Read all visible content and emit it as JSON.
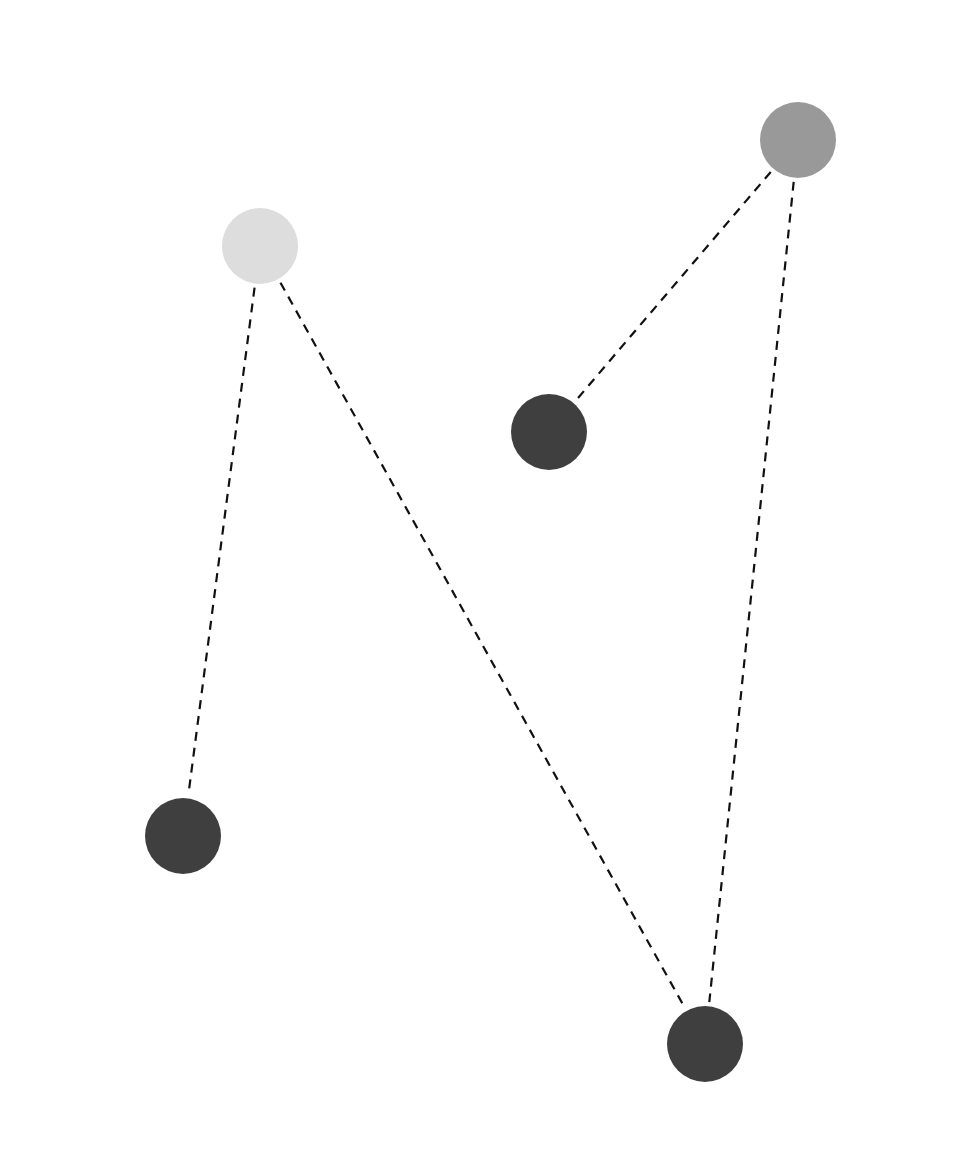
{
  "diagram": {
    "type": "graph",
    "width": 977,
    "height": 1167,
    "background": "#ffffff",
    "edge_style": {
      "color": "#111111",
      "width": 2.2,
      "dash": "9,7"
    },
    "nodes": [
      {
        "id": "A",
        "x": 260,
        "y": 246,
        "r": 38,
        "color": "#dddddd"
      },
      {
        "id": "B",
        "x": 798,
        "y": 140,
        "r": 38,
        "color": "#999999"
      },
      {
        "id": "C",
        "x": 549,
        "y": 432,
        "r": 38,
        "color": "#3f3f3f"
      },
      {
        "id": "D",
        "x": 183,
        "y": 836,
        "r": 38,
        "color": "#3f3f3f"
      },
      {
        "id": "E",
        "x": 705,
        "y": 1044,
        "r": 38,
        "color": "#3f3f3f"
      }
    ],
    "edges": [
      {
        "from": "A",
        "to": "D"
      },
      {
        "from": "A",
        "to": "E"
      },
      {
        "from": "B",
        "to": "C"
      },
      {
        "from": "B",
        "to": "E"
      }
    ]
  }
}
